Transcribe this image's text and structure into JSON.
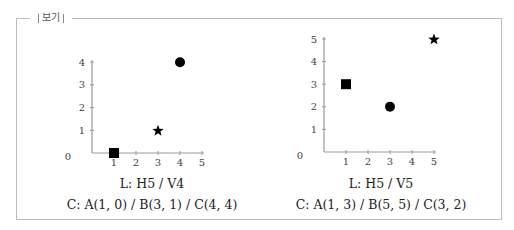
{
  "box": {
    "legend": "보기"
  },
  "chart_data": [
    {
      "type": "scatter",
      "title": "L: H5 / V4",
      "xlim": [
        0,
        5
      ],
      "ylim": [
        0,
        4
      ],
      "x_ticks": [
        "1",
        "2",
        "3",
        "4",
        "5"
      ],
      "y_ticks": [
        "1",
        "2",
        "3",
        "4"
      ],
      "origin_label": "0",
      "points": [
        {
          "name": "A",
          "x": 1,
          "y": 0,
          "marker": "square"
        },
        {
          "name": "B",
          "x": 3,
          "y": 1,
          "marker": "star"
        },
        {
          "name": "C",
          "x": 4,
          "y": 4,
          "marker": "circle"
        }
      ],
      "caption_l": "L: H5 / V4",
      "caption_c": "C: A(1, 0) / B(3, 1) / C(4, 4)"
    },
    {
      "type": "scatter",
      "title": "L: H5 / V5",
      "xlim": [
        0,
        5
      ],
      "ylim": [
        0,
        5
      ],
      "x_ticks": [
        "1",
        "2",
        "3",
        "4",
        "5"
      ],
      "y_ticks": [
        "1",
        "2",
        "3",
        "4",
        "5"
      ],
      "origin_label": "0",
      "points": [
        {
          "name": "A",
          "x": 1,
          "y": 3,
          "marker": "square"
        },
        {
          "name": "B",
          "x": 5,
          "y": 5,
          "marker": "star"
        },
        {
          "name": "C",
          "x": 3,
          "y": 2,
          "marker": "circle"
        }
      ],
      "caption_l": "L: H5 / V5",
      "caption_c": "C: A(1, 3) / B(5, 5) / C(3, 2)"
    }
  ]
}
